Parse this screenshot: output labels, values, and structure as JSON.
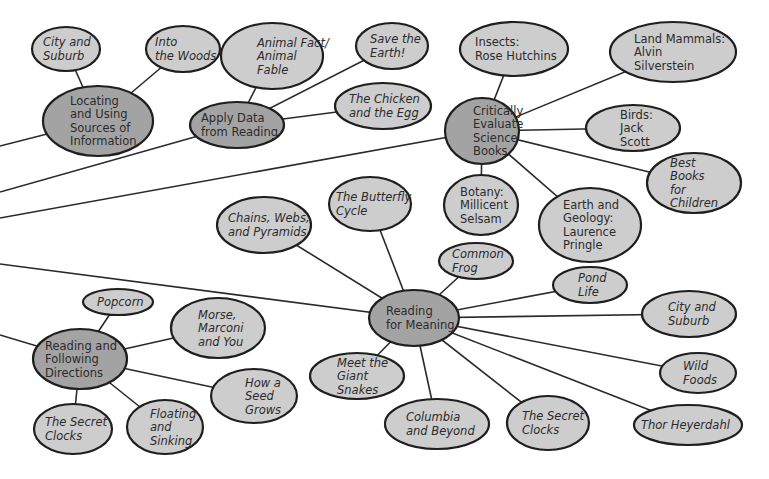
{
  "diagram": {
    "type": "concept-web",
    "colors": {
      "hub_fill": "#a3a3a3",
      "leaf_fill": "#cdcdcd",
      "stroke": "#1e1e1e",
      "text": "#2b2b2b",
      "background": "#ffffff"
    },
    "nodes": [
      {
        "id": "locating",
        "kind": "hub",
        "italic": false,
        "cx": 98,
        "cy": 121,
        "rx": 55,
        "ry": 35,
        "lines": [
          "Locating",
          "and Using",
          "Sources of",
          "Information"
        ],
        "tx": 70
      },
      {
        "id": "city-suburb-1",
        "kind": "leaf",
        "italic": true,
        "cx": 66,
        "cy": 49,
        "rx": 34,
        "ry": 22,
        "lines": [
          "City and",
          "Suburb"
        ],
        "tx": 43
      },
      {
        "id": "into-woods",
        "kind": "leaf",
        "italic": true,
        "cx": 183,
        "cy": 49,
        "rx": 37,
        "ry": 23,
        "lines": [
          "Into",
          "the Woods"
        ],
        "tx": 155
      },
      {
        "id": "apply-data",
        "kind": "hub",
        "italic": false,
        "cx": 237,
        "cy": 125,
        "rx": 47,
        "ry": 23,
        "lines": [
          "Apply Data",
          "from Reading"
        ],
        "tx": 201
      },
      {
        "id": "animal-fact",
        "kind": "leaf",
        "italic": true,
        "cx": 272,
        "cy": 56,
        "rx": 51,
        "ry": 33,
        "lines": [
          "Animal Fact/",
          "Animal",
          "Fable"
        ],
        "tx": 257
      },
      {
        "id": "save-earth",
        "kind": "leaf",
        "italic": true,
        "cx": 392,
        "cy": 46,
        "rx": 36,
        "ry": 23,
        "lines": [
          "Save the",
          "Earth!"
        ],
        "tx": 370
      },
      {
        "id": "chicken-egg",
        "kind": "leaf",
        "italic": true,
        "cx": 383,
        "cy": 106,
        "rx": 48,
        "ry": 23,
        "lines": [
          "The Chicken",
          "and the Egg"
        ],
        "tx": 349
      },
      {
        "id": "critically",
        "kind": "hub",
        "italic": false,
        "cx": 482,
        "cy": 131,
        "rx": 37,
        "ry": 33,
        "lines": [
          "Critically",
          "Evaluate",
          "Science",
          "Books"
        ],
        "tx": 473
      },
      {
        "id": "insects",
        "kind": "leaf",
        "italic": false,
        "cx": 514,
        "cy": 49,
        "rx": 54,
        "ry": 27,
        "lines": [
          "Insects:",
          "Rose Hutchins"
        ],
        "tx": 475
      },
      {
        "id": "land-mammals",
        "kind": "leaf",
        "italic": false,
        "cx": 673,
        "cy": 52,
        "rx": 63,
        "ry": 30,
        "lines": [
          "Land Mammals:",
          "Alvin",
          "Silverstein"
        ],
        "tx": 634
      },
      {
        "id": "birds",
        "kind": "leaf",
        "italic": false,
        "cx": 633,
        "cy": 128,
        "rx": 47,
        "ry": 23,
        "lines": [
          "Birds:",
          "Jack",
          "Scott"
        ],
        "tx": 620
      },
      {
        "id": "best-books",
        "kind": "leaf",
        "italic": true,
        "cx": 694,
        "cy": 183,
        "rx": 47,
        "ry": 30,
        "lines": [
          "Best",
          "Books",
          "for",
          "Children"
        ],
        "tx": 670
      },
      {
        "id": "botany",
        "kind": "leaf",
        "italic": false,
        "cx": 481,
        "cy": 205,
        "rx": 37,
        "ry": 30,
        "lines": [
          "Botany:",
          "Millicent",
          "Selsam"
        ],
        "tx": 460
      },
      {
        "id": "earth-geology",
        "kind": "leaf",
        "italic": false,
        "cx": 590,
        "cy": 225,
        "rx": 51,
        "ry": 37,
        "lines": [
          "Earth and",
          "Geology:",
          "Laurence",
          "Pringle"
        ],
        "tx": 563
      },
      {
        "id": "reading-meaning",
        "kind": "hub",
        "italic": false,
        "cx": 414,
        "cy": 318,
        "rx": 45,
        "ry": 28,
        "lines": [
          "Reading",
          "for Meaning"
        ],
        "tx": 386
      },
      {
        "id": "chains-webs",
        "kind": "leaf",
        "italic": true,
        "cx": 264,
        "cy": 225,
        "rx": 47,
        "ry": 28,
        "lines": [
          "Chains, Webs,",
          "and Pyramids"
        ],
        "tx": 228
      },
      {
        "id": "butterfly",
        "kind": "leaf",
        "italic": true,
        "cx": 370,
        "cy": 204,
        "rx": 41,
        "ry": 27,
        "lines": [
          "The Butterfly",
          "Cycle"
        ],
        "tx": 336
      },
      {
        "id": "common-frog",
        "kind": "leaf",
        "italic": true,
        "cx": 476,
        "cy": 261,
        "rx": 37,
        "ry": 18,
        "lines": [
          "Common",
          "Frog"
        ],
        "tx": 452
      },
      {
        "id": "pond-life",
        "kind": "leaf",
        "italic": true,
        "cx": 590,
        "cy": 285,
        "rx": 37,
        "ry": 18,
        "lines": [
          "Pond",
          "Life"
        ],
        "tx": 578
      },
      {
        "id": "city-suburb-2",
        "kind": "leaf",
        "italic": true,
        "cx": 689,
        "cy": 314,
        "rx": 47,
        "ry": 23,
        "lines": [
          "City and",
          "Suburb"
        ],
        "tx": 668
      },
      {
        "id": "wild-foods",
        "kind": "leaf",
        "italic": true,
        "cx": 698,
        "cy": 373,
        "rx": 38,
        "ry": 20,
        "lines": [
          "Wild",
          "Foods"
        ],
        "tx": 683
      },
      {
        "id": "thor",
        "kind": "leaf",
        "italic": true,
        "cx": 688,
        "cy": 425,
        "rx": 54,
        "ry": 20,
        "lines": [
          "Thor Heyerdahl"
        ],
        "tx": 641
      },
      {
        "id": "secret-clocks-2",
        "kind": "leaf",
        "italic": true,
        "cx": 548,
        "cy": 423,
        "rx": 41,
        "ry": 27,
        "lines": [
          "The Secret",
          "Clocks"
        ],
        "tx": 522
      },
      {
        "id": "columbia",
        "kind": "leaf",
        "italic": true,
        "cx": 437,
        "cy": 424,
        "rx": 52,
        "ry": 25,
        "lines": [
          "Columbia",
          "and Beyond"
        ],
        "tx": 406
      },
      {
        "id": "giant-snakes",
        "kind": "leaf",
        "italic": true,
        "cx": 357,
        "cy": 376,
        "rx": 47,
        "ry": 23,
        "lines": [
          "Meet the",
          "Giant",
          "Snakes"
        ],
        "tx": 337
      },
      {
        "id": "reading-directions",
        "kind": "hub",
        "italic": false,
        "cx": 80,
        "cy": 359,
        "rx": 47,
        "ry": 30,
        "lines": [
          "Reading and",
          "Following",
          "Directions"
        ],
        "tx": 45
      },
      {
        "id": "popcorn",
        "kind": "leaf",
        "italic": true,
        "cx": 118,
        "cy": 302,
        "rx": 35,
        "ry": 13,
        "lines": [
          "Popcorn"
        ],
        "tx": 97
      },
      {
        "id": "morse",
        "kind": "leaf",
        "italic": true,
        "cx": 218,
        "cy": 328,
        "rx": 47,
        "ry": 30,
        "lines": [
          "Morse,",
          "Marconi",
          "and You"
        ],
        "tx": 198
      },
      {
        "id": "seed-grows",
        "kind": "leaf",
        "italic": true,
        "cx": 254,
        "cy": 396,
        "rx": 43,
        "ry": 27,
        "lines": [
          "How a",
          "Seed",
          "Grows"
        ],
        "tx": 245
      },
      {
        "id": "floating",
        "kind": "leaf",
        "italic": true,
        "cx": 165,
        "cy": 427,
        "rx": 38,
        "ry": 27,
        "lines": [
          "Floating",
          "and",
          "Sinking"
        ],
        "tx": 150
      },
      {
        "id": "secret-clocks-1",
        "kind": "leaf",
        "italic": true,
        "cx": 73,
        "cy": 429,
        "rx": 39,
        "ry": 25,
        "lines": [
          "The Secret",
          "Clocks"
        ],
        "tx": 45
      }
    ],
    "edges": [
      {
        "from": "locating",
        "to": "city-suburb-1"
      },
      {
        "from": "locating",
        "to": "into-woods"
      },
      {
        "from": "apply-data",
        "to": "animal-fact"
      },
      {
        "from": "apply-data",
        "to": "save-earth"
      },
      {
        "from": "apply-data",
        "to": "chicken-egg"
      },
      {
        "from": "critically",
        "to": "insects"
      },
      {
        "from": "critically",
        "to": "land-mammals"
      },
      {
        "from": "critically",
        "to": "birds"
      },
      {
        "from": "critically",
        "to": "best-books"
      },
      {
        "from": "critically",
        "to": "botany"
      },
      {
        "from": "critically",
        "to": "earth-geology"
      },
      {
        "from": "reading-meaning",
        "to": "chains-webs"
      },
      {
        "from": "reading-meaning",
        "to": "butterfly"
      },
      {
        "from": "reading-meaning",
        "to": "common-frog"
      },
      {
        "from": "reading-meaning",
        "to": "pond-life"
      },
      {
        "from": "reading-meaning",
        "to": "city-suburb-2"
      },
      {
        "from": "reading-meaning",
        "to": "wild-foods"
      },
      {
        "from": "reading-meaning",
        "to": "thor"
      },
      {
        "from": "reading-meaning",
        "to": "secret-clocks-2"
      },
      {
        "from": "reading-meaning",
        "to": "columbia"
      },
      {
        "from": "reading-meaning",
        "to": "giant-snakes"
      },
      {
        "from": "reading-directions",
        "to": "popcorn"
      },
      {
        "from": "reading-directions",
        "to": "morse"
      },
      {
        "from": "reading-directions",
        "to": "seed-grows"
      },
      {
        "from": "reading-directions",
        "to": "floating"
      },
      {
        "from": "reading-directions",
        "to": "secret-clocks-1"
      }
    ],
    "offscreen_edges": [
      {
        "to": "locating",
        "x1": 0,
        "y1": 146
      },
      {
        "to": "apply-data",
        "x1": 0,
        "y1": 192
      },
      {
        "to": "critically",
        "x1": 0,
        "y1": 218
      },
      {
        "to": "reading-meaning",
        "x1": 0,
        "y1": 264
      },
      {
        "to": "reading-directions",
        "x1": 0,
        "y1": 335
      }
    ]
  }
}
